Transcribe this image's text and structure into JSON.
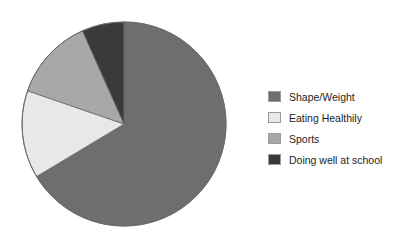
{
  "chart_data": {
    "type": "pie",
    "title": "",
    "subtitle": "",
    "xlabel": "",
    "ylabel": "",
    "grid": false,
    "legend_position": "right",
    "start_angle_deg": 0,
    "direction": "clockwise",
    "categories": [
      "Shape/Weight",
      "Eating Healthily",
      "Sports",
      "Doing well at school"
    ],
    "values": [
      66,
      14,
      13,
      7
    ],
    "colors": [
      "#6e6e6e",
      "#e8e8e8",
      "#a8a8a8",
      "#3a3a3a"
    ],
    "slices": [
      {
        "label": "Shape/Weight",
        "value": 66,
        "color": "#6e6e6e",
        "start_deg": 0,
        "end_deg": 239
      },
      {
        "label": "Eating Healthily",
        "value": 14,
        "color": "#e8e8e8",
        "start_deg": 239,
        "end_deg": 289
      },
      {
        "label": "Sports",
        "value": 13,
        "color": "#a8a8a8",
        "start_deg": 289,
        "end_deg": 336
      },
      {
        "label": "Doing well at school",
        "value": 7,
        "color": "#3a3a3a",
        "start_deg": 336,
        "end_deg": 360
      }
    ],
    "geometry": {
      "center_x": 124,
      "center_y": 124,
      "radius": 102,
      "outline_color": "#6a6a6a"
    }
  },
  "legend": {
    "items": [
      {
        "label": "Shape/Weight",
        "swatch_color": "#6e6e6e",
        "swatch_name": "legend-swatch-shape-weight"
      },
      {
        "label": "Eating Healthily",
        "swatch_color": "#e8e8e8",
        "swatch_name": "legend-swatch-eating-healthily"
      },
      {
        "label": "Sports",
        "swatch_color": "#a8a8a8",
        "swatch_name": "legend-swatch-sports"
      },
      {
        "label": "Doing well at school",
        "swatch_color": "#3a3a3a",
        "swatch_name": "legend-swatch-doing-well-at-school"
      }
    ]
  }
}
